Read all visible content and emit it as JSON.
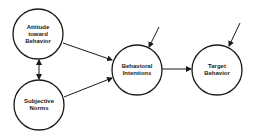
{
  "diagram": {
    "type": "path-model",
    "nodes": [
      {
        "id": "attitude",
        "label": "Attitude\ntoward\nBehavior",
        "cx": 38,
        "cy": 34,
        "r": 25
      },
      {
        "id": "norms",
        "label": "Subjective\nNorms",
        "cx": 39,
        "cy": 105,
        "r": 25
      },
      {
        "id": "intentions",
        "label": "Behavioral\nIntentions",
        "cx": 137,
        "cy": 70,
        "r": 25
      },
      {
        "id": "target",
        "label": "Target\nBehavior",
        "cx": 217,
        "cy": 70,
        "r": 25
      }
    ],
    "edges": [
      {
        "from": "attitude",
        "to": "intentions",
        "directed": true
      },
      {
        "from": "norms",
        "to": "intentions",
        "directed": true
      },
      {
        "from": "attitude",
        "to": "norms",
        "directed": true,
        "bidirectional": true
      },
      {
        "from": "intentions",
        "to": "target",
        "directed": true
      },
      {
        "from": "external",
        "to": "intentions",
        "directed": true
      },
      {
        "from": "external",
        "to": "target",
        "directed": true
      }
    ],
    "colors": {
      "stroke": "#1a1a1a",
      "background": "#ffffff"
    }
  }
}
